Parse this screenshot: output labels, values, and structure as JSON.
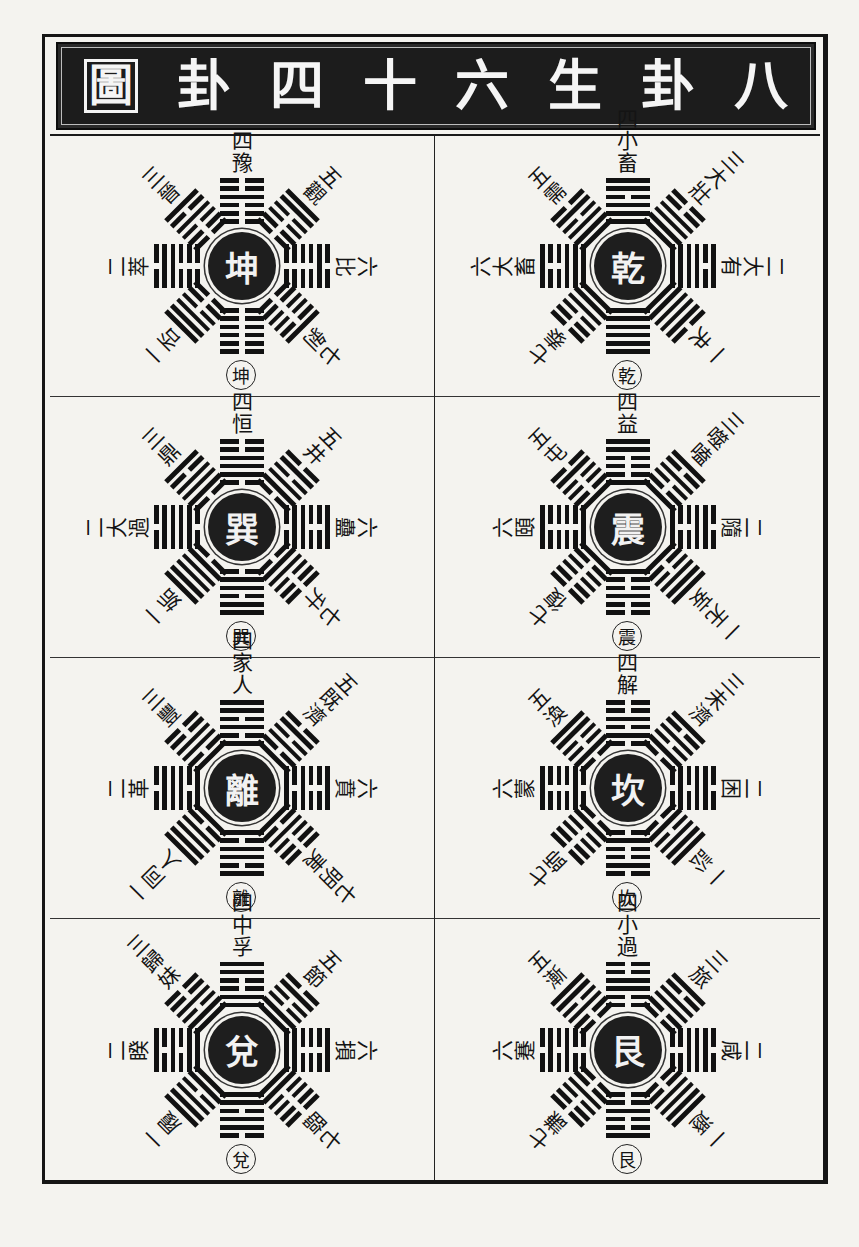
{
  "title": {
    "text_rtl": [
      "八",
      "卦",
      "生",
      "六",
      "十",
      "四",
      "卦",
      "圖"
    ]
  },
  "colors": {
    "ink": "#141414",
    "paper": "#f4f3ef",
    "title_bg": "#1c1c1c"
  },
  "trigrams": {
    "乾": [
      1,
      1,
      1
    ],
    "兌": [
      1,
      1,
      0
    ],
    "離": [
      1,
      0,
      1
    ],
    "震": [
      1,
      0,
      0
    ],
    "巽": [
      0,
      1,
      1
    ],
    "坎": [
      0,
      1,
      0
    ],
    "艮": [
      0,
      0,
      1
    ],
    "坤": [
      0,
      0,
      0
    ]
  },
  "cells": [
    {
      "palace": "乾",
      "col": "right",
      "row": 0,
      "spokes": [
        {
          "dir": "top",
          "num": "四",
          "name": "小畜",
          "upper": "巽"
        },
        {
          "dir": "upper-right",
          "num": "三",
          "name": "大壯",
          "upper": "震"
        },
        {
          "dir": "right",
          "num": "二",
          "name": "大有",
          "upper": "離"
        },
        {
          "dir": "lower-right",
          "num": "一",
          "name": "夬",
          "upper": "兌"
        },
        {
          "dir": "lower-left",
          "num": "七",
          "name": "泰",
          "upper": "坤"
        },
        {
          "dir": "left",
          "num": "六",
          "name": "大畜",
          "upper": "艮"
        },
        {
          "dir": "upper-left",
          "num": "五",
          "name": "需",
          "upper": "坎"
        }
      ]
    },
    {
      "palace": "坤",
      "col": "left",
      "row": 0,
      "spokes": [
        {
          "dir": "top",
          "num": "四",
          "name": "豫",
          "upper": "震"
        },
        {
          "dir": "upper-right",
          "num": "五",
          "name": "觀",
          "upper": "巽"
        },
        {
          "dir": "right",
          "num": "六",
          "name": "比",
          "upper": "坎"
        },
        {
          "dir": "lower-right",
          "num": "七",
          "name": "剝",
          "upper": "艮"
        },
        {
          "dir": "lower-left",
          "num": "一",
          "name": "否",
          "upper": "乾"
        },
        {
          "dir": "left",
          "num": "二",
          "name": "萃",
          "upper": "兌"
        },
        {
          "dir": "upper-left",
          "num": "三",
          "name": "晉",
          "upper": "離"
        }
      ]
    },
    {
      "palace": "震",
      "col": "right",
      "row": 1,
      "spokes": [
        {
          "dir": "top",
          "num": "四",
          "name": "益",
          "upper": "巽"
        },
        {
          "dir": "upper-right",
          "num": "三",
          "name": "噬嗑",
          "upper": "離"
        },
        {
          "dir": "right",
          "num": "二",
          "name": "隨",
          "upper": "兌"
        },
        {
          "dir": "lower-right",
          "num": "一",
          "name": "无妄",
          "upper": "乾"
        },
        {
          "dir": "lower-left",
          "num": "七",
          "name": "復",
          "upper": "坤"
        },
        {
          "dir": "left",
          "num": "六",
          "name": "頤",
          "upper": "艮"
        },
        {
          "dir": "upper-left",
          "num": "五",
          "name": "屯",
          "upper": "坎"
        }
      ]
    },
    {
      "palace": "巽",
      "col": "left",
      "row": 1,
      "spokes": [
        {
          "dir": "top",
          "num": "四",
          "name": "恒",
          "upper": "震"
        },
        {
          "dir": "upper-right",
          "num": "五",
          "name": "井",
          "upper": "坎"
        },
        {
          "dir": "right",
          "num": "六",
          "name": "蠱",
          "upper": "艮"
        },
        {
          "dir": "lower-right",
          "num": "七",
          "name": "升",
          "upper": "坤"
        },
        {
          "dir": "lower-left",
          "num": "一",
          "name": "姤",
          "upper": "乾"
        },
        {
          "dir": "left",
          "num": "二",
          "name": "大過",
          "upper": "兌"
        },
        {
          "dir": "upper-left",
          "num": "三",
          "name": "鼎",
          "upper": "離"
        }
      ]
    },
    {
      "palace": "坎",
      "col": "right",
      "row": 2,
      "spokes": [
        {
          "dir": "top",
          "num": "四",
          "name": "解",
          "upper": "震"
        },
        {
          "dir": "upper-right",
          "num": "三",
          "name": "未濟",
          "upper": "離"
        },
        {
          "dir": "right",
          "num": "二",
          "name": "困",
          "upper": "兌"
        },
        {
          "dir": "lower-right",
          "num": "一",
          "name": "訟",
          "upper": "乾"
        },
        {
          "dir": "lower-left",
          "num": "七",
          "name": "師",
          "upper": "坤"
        },
        {
          "dir": "left",
          "num": "六",
          "name": "蒙",
          "upper": "艮"
        },
        {
          "dir": "upper-left",
          "num": "五",
          "name": "渙",
          "upper": "巽"
        }
      ]
    },
    {
      "palace": "離",
      "col": "left",
      "row": 2,
      "spokes": [
        {
          "dir": "top",
          "num": "四",
          "name": "家人",
          "upper": "巽"
        },
        {
          "dir": "upper-right",
          "num": "五",
          "name": "既濟",
          "upper": "坎"
        },
        {
          "dir": "right",
          "num": "六",
          "name": "賁",
          "upper": "艮"
        },
        {
          "dir": "lower-right",
          "num": "七",
          "name": "明夷",
          "upper": "坤"
        },
        {
          "dir": "lower-left",
          "num": "一",
          "name": "同人",
          "upper": "乾"
        },
        {
          "dir": "left",
          "num": "二",
          "name": "革",
          "upper": "兌"
        },
        {
          "dir": "upper-left",
          "num": "三",
          "name": "豐",
          "upper": "震"
        }
      ]
    },
    {
      "palace": "艮",
      "col": "right",
      "row": 3,
      "spokes": [
        {
          "dir": "top",
          "num": "四",
          "name": "小過",
          "upper": "震"
        },
        {
          "dir": "upper-right",
          "num": "三",
          "name": "旅",
          "upper": "離"
        },
        {
          "dir": "right",
          "num": "二",
          "name": "咸",
          "upper": "兌"
        },
        {
          "dir": "lower-right",
          "num": "一",
          "name": "遯",
          "upper": "乾"
        },
        {
          "dir": "lower-left",
          "num": "七",
          "name": "謙",
          "upper": "坤"
        },
        {
          "dir": "left",
          "num": "六",
          "name": "蹇",
          "upper": "坎"
        },
        {
          "dir": "upper-left",
          "num": "五",
          "name": "漸",
          "upper": "巽"
        }
      ]
    },
    {
      "palace": "兌",
      "col": "left",
      "row": 3,
      "spokes": [
        {
          "dir": "top",
          "num": "四",
          "name": "中孚",
          "upper": "巽"
        },
        {
          "dir": "upper-right",
          "num": "五",
          "name": "節",
          "upper": "坎"
        },
        {
          "dir": "right",
          "num": "六",
          "name": "損",
          "upper": "艮"
        },
        {
          "dir": "lower-right",
          "num": "七",
          "name": "臨",
          "upper": "坤"
        },
        {
          "dir": "lower-left",
          "num": "一",
          "name": "履",
          "upper": "乾"
        },
        {
          "dir": "left",
          "num": "二",
          "name": "睽",
          "upper": "離"
        },
        {
          "dir": "upper-left",
          "num": "三",
          "name": "歸妹",
          "upper": "震"
        }
      ]
    }
  ]
}
